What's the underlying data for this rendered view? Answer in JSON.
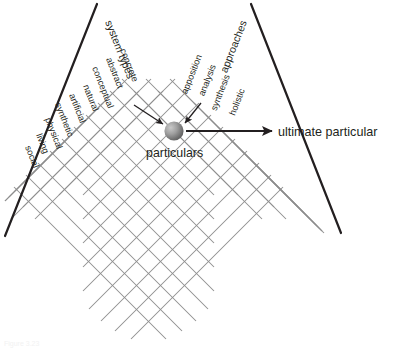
{
  "figure": {
    "background_color": "#ffffff",
    "line_color": "#231f20",
    "grid_color": "#8d8d8d",
    "sphere_color_light": "#b8b8b8",
    "sphere_color_dark": "#5a5a5a"
  },
  "axes": {
    "left": {
      "title": "system types",
      "labels": [
        "concrete",
        "abstract",
        "conceptual",
        "natural",
        "artificial",
        "synthetic",
        "physical",
        "living",
        "social"
      ]
    },
    "right": {
      "title": "approaches",
      "labels": [
        "apposition",
        "analysis",
        "synthesis",
        "holistic"
      ]
    }
  },
  "annotations": {
    "center_label": "particulars",
    "callout_label": "ultimate particular"
  },
  "caption": {
    "text": "Figure 3.23"
  }
}
